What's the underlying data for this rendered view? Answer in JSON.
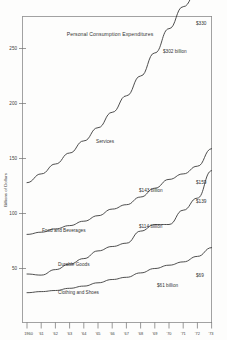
{
  "chart_data": {
    "type": "line",
    "title": "Personal Consumption Expenditures",
    "xlabel": "",
    "ylabel": "Billions of Dollars",
    "grid": false,
    "legend_position": "inline-labels",
    "x": [
      1960,
      1961,
      1962,
      1963,
      1964,
      1965,
      1966,
      1967,
      1968,
      1969,
      1970,
      1971,
      1972,
      1973
    ],
    "xtick_labels": [
      "1960",
      "'61",
      "'62",
      "'63",
      "'64",
      "'65",
      "'66",
      "'67",
      "'68",
      "'69",
      "'70",
      "'71",
      "'72",
      "'73"
    ],
    "ytick_labels": [
      "50",
      "100",
      "150",
      "200",
      "250",
      "300"
    ],
    "yticks": [
      50,
      100,
      150,
      200,
      250,
      300
    ],
    "ylim": [
      20,
      345
    ],
    "xlim": [
      1960,
      1973
    ],
    "series": [
      {
        "name": "Services",
        "label": "Services",
        "end_label": "$330",
        "mid_label": "$302 billion",
        "values": [
          128,
          136,
          145,
          155,
          166,
          178,
          192,
          207,
          225,
          246,
          268,
          288,
          302,
          330
        ]
      },
      {
        "name": "Food and Beverages",
        "label": "Food and Beverages",
        "end_label": "$159",
        "mid_label": "$143 billion",
        "values": [
          81,
          83,
          86,
          89,
          93,
          98,
          104,
          108,
          115,
          123,
          131,
          136,
          143,
          159
        ]
      },
      {
        "name": "Durable Goods",
        "label": "Durable Goods",
        "end_label": "$139",
        "mid_label": "$114 billion",
        "values": [
          45,
          44,
          49,
          54,
          59,
          66,
          70,
          73,
          84,
          90,
          90,
          103,
          114,
          139
        ]
      },
      {
        "name": "Clothing and Shoes",
        "label": "Clothing and Shoes",
        "end_label": "$69",
        "mid_label": "$61 billion",
        "values": [
          28,
          29,
          30,
          32,
          34,
          37,
          40,
          42,
          46,
          50,
          53,
          56,
          61,
          69
        ]
      }
    ]
  },
  "chart": {
    "title": "Personal Consumption Expenditures",
    "ylabel": "Billions of Dollars",
    "ytick_0": "50",
    "ytick_1": "100",
    "ytick_2": "150",
    "ytick_3": "200",
    "ytick_4": "250",
    "ytick_5": "300",
    "xtick_0": "1960",
    "xtick_1": "'61",
    "xtick_2": "'62",
    "xtick_3": "'63",
    "xtick_4": "'64",
    "xtick_5": "'65",
    "xtick_6": "'66",
    "xtick_7": "'67",
    "xtick_8": "'68",
    "xtick_9": "'69",
    "xtick_10": "'70",
    "xtick_11": "'71",
    "xtick_12": "'72",
    "xtick_13": "'73",
    "label_services": "Services",
    "label_food": "Food and Beverages",
    "label_durable": "Durable Goods",
    "label_clothing": "Clothing and Shoes",
    "ann_services_end": "$330",
    "ann_services_mid": "$302 billion",
    "ann_food_end": "$159",
    "ann_food_mid": "$143 billion",
    "ann_durable_end": "$139",
    "ann_durable_mid": "$114 billion",
    "ann_clothing_end": "$69",
    "ann_clothing_mid": "$61 billion"
  },
  "colors": {
    "line": "#3a3a3a",
    "axis": "#8a8a8a",
    "text": "#333333",
    "background": "#fdfdfc"
  }
}
